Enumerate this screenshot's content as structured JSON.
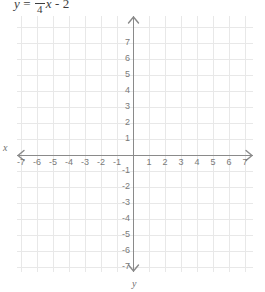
{
  "equation": {
    "lhs": "y",
    "equals": "=",
    "fraction_numerator": "3",
    "fraction_denominator": "4",
    "variable": "x",
    "operator": "-",
    "constant": "2"
  },
  "axis_labels": {
    "x_axis_letter": "x",
    "y_axis_letter": "y"
  },
  "colors": {
    "grid_line": "#e8e8e8",
    "axis_line": "#8a8a8a",
    "tick_text": "#7a7a7a",
    "equation_text": "#3d3d3d",
    "background": "#ffffff"
  },
  "chart_data": {
    "type": "line",
    "title": "",
    "subtitle": "",
    "annotations": [
      "y = 3/4 x - 2"
    ],
    "xlabel": "x",
    "ylabel": "y",
    "xlim": [
      -7.5,
      7.5
    ],
    "ylim": [
      -8.0,
      8.0
    ],
    "grid": true,
    "legend": "none",
    "grid_step": 1,
    "pixels_per_unit": 16,
    "origin_px": [
      133,
      155
    ],
    "x_ticks": [
      -7,
      -6,
      -5,
      -4,
      -3,
      -2,
      -1,
      1,
      2,
      3,
      4,
      5,
      6,
      7
    ],
    "y_ticks": [
      7,
      6,
      5,
      4,
      3,
      2,
      1,
      -1,
      -2,
      -3,
      -4,
      -5,
      -6,
      -7
    ],
    "x_tick_labels": [
      "-7",
      "-6",
      "-5",
      "-4",
      "-3",
      "-2",
      "-1",
      "1",
      "2",
      "3",
      "4",
      "5",
      "6",
      "7"
    ],
    "y_tick_labels": [
      "7",
      "6",
      "5",
      "4",
      "3",
      "2",
      "1",
      "-1",
      "-2",
      "-3",
      "-4",
      "-5",
      "-6",
      "-7"
    ],
    "series": [
      {
        "name": "y = 3/4 x - 2",
        "slope": 0.75,
        "intercept": -2,
        "drawn": false,
        "x": [],
        "values": []
      }
    ],
    "axis_arrows": [
      "left",
      "right",
      "up",
      "down"
    ]
  }
}
